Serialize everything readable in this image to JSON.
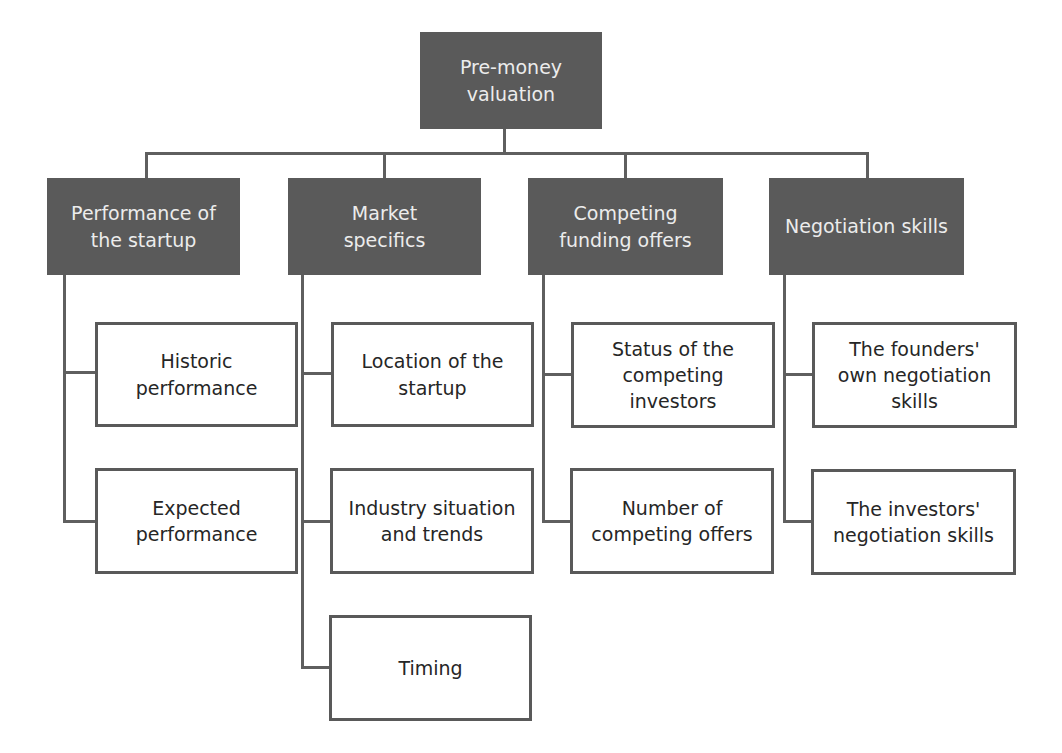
{
  "diagram": {
    "type": "hierarchy",
    "root": {
      "label": "Pre-money valuation",
      "lines": [
        "Pre-money",
        "valuation"
      ]
    },
    "categories": [
      {
        "label": "Performance of the startup",
        "lines": [
          "Performance of",
          "the startup"
        ],
        "children": [
          {
            "label": "Historic performance",
            "lines": [
              "Historic",
              "performance"
            ]
          },
          {
            "label": "Expected performance",
            "lines": [
              "Expected",
              "performance"
            ]
          }
        ]
      },
      {
        "label": "Market specifics",
        "lines": [
          "Market",
          "specifics"
        ],
        "children": [
          {
            "label": "Location of the startup",
            "lines": [
              "Location of the",
              "startup"
            ]
          },
          {
            "label": "Industry situation and trends",
            "lines": [
              "Industry situation",
              "and trends"
            ]
          },
          {
            "label": "Timing",
            "lines": [
              "Timing"
            ]
          }
        ]
      },
      {
        "label": "Competing funding offers",
        "lines": [
          "Competing",
          "funding offers"
        ],
        "children": [
          {
            "label": "Status of the competing investors",
            "lines": [
              "Status of the",
              "competing",
              "investors"
            ]
          },
          {
            "label": "Number of competing offers",
            "lines": [
              "Number of",
              "competing offers"
            ]
          }
        ]
      },
      {
        "label": "Negotiation skills",
        "lines": [
          "Negotiation skills"
        ],
        "children": [
          {
            "label": "The founders' own negotiation skills",
            "lines": [
              "The founders'",
              "own negotiation",
              "skills"
            ]
          },
          {
            "label": "The investors' negotiation skills",
            "lines": [
              "The investors'",
              "negotiation skills"
            ]
          }
        ]
      }
    ]
  },
  "colors": {
    "dark_box": "#5a5a5a",
    "dark_text": "#ececec",
    "light_border": "#595959",
    "light_text": "#262626",
    "connector": "#5f5f5f"
  }
}
